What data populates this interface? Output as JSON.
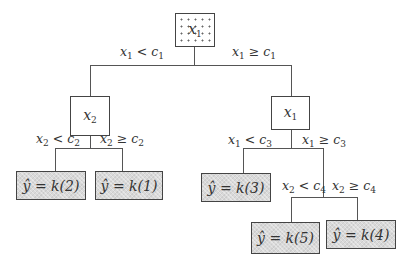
{
  "tree": {
    "root": {
      "label": "x",
      "sub": "1",
      "fill": "dotted"
    },
    "root_edges": {
      "left": {
        "var": "x",
        "var_sub": "1",
        "op": "<",
        "thr": "c",
        "thr_sub": "1"
      },
      "right": {
        "var": "x",
        "var_sub": "1",
        "op": "≥",
        "thr": "c",
        "thr_sub": "1"
      }
    },
    "left_node": {
      "label": "x",
      "sub": "2"
    },
    "left_edges": {
      "left": {
        "var": "x",
        "var_sub": "2",
        "op": "<",
        "thr": "c",
        "thr_sub": "2"
      },
      "right": {
        "var": "x",
        "var_sub": "2",
        "op": "≥",
        "thr": "c",
        "thr_sub": "2"
      }
    },
    "right_node": {
      "label": "x",
      "sub": "1"
    },
    "right_edges": {
      "left": {
        "var": "x",
        "var_sub": "1",
        "op": "<",
        "thr": "c",
        "thr_sub": "3"
      },
      "right": {
        "var": "x",
        "var_sub": "1",
        "op": "≥",
        "thr": "c",
        "thr_sub": "3"
      }
    },
    "sub_edges": {
      "left": {
        "var": "x",
        "var_sub": "2",
        "op": "<",
        "thr": "c",
        "thr_sub": "4"
      },
      "right": {
        "var": "x",
        "var_sub": "2",
        "op": "≥",
        "thr": "c",
        "thr_sub": "4"
      }
    },
    "leaves": [
      {
        "text": "ŷ = k(2)"
      },
      {
        "text": "ŷ = k(1)"
      },
      {
        "text": "ŷ = k(3)"
      },
      {
        "text": "ŷ = k(5)"
      },
      {
        "text": "ŷ = k(4)"
      }
    ],
    "colors": {
      "leaf_fill": "#d9d9d9",
      "line": "#555555",
      "border": "#444444"
    }
  }
}
